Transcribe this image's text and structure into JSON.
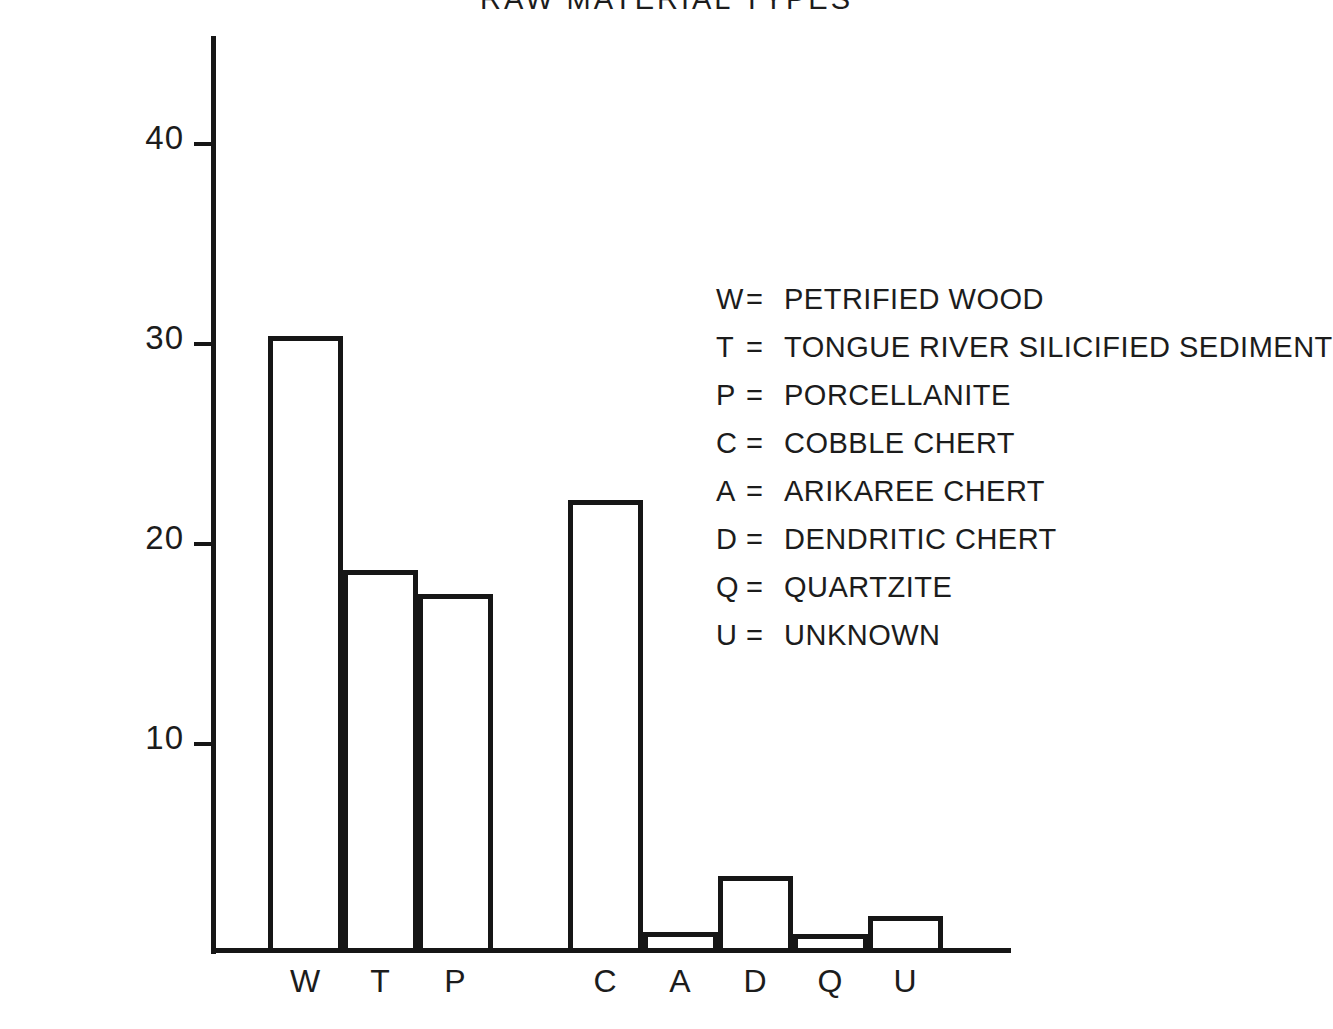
{
  "chart_data": {
    "type": "bar",
    "title": "RAW MATERIAL TYPES",
    "xlabel": "",
    "ylabel": "PERCENT",
    "ylim": [
      0,
      45
    ],
    "yticks": [
      10,
      20,
      30,
      40
    ],
    "grid": false,
    "legend_position": "inside-right",
    "categories": [
      "W",
      "T",
      "P",
      "C",
      "A",
      "D",
      "Q",
      "U"
    ],
    "values": [
      30.6,
      18.9,
      17.7,
      22.4,
      0.8,
      3.6,
      0.7,
      1.6
    ],
    "series": [
      {
        "name": "PERCENT",
        "values": [
          30.6,
          18.9,
          17.7,
          22.4,
          0.8,
          3.6,
          0.7,
          1.6
        ]
      }
    ],
    "legend_entries": [
      {
        "key": "W",
        "eq": "=",
        "description": "PETRIFIED WOOD"
      },
      {
        "key": "T",
        "eq": "=",
        "description": "TONGUE RIVER SILICIFIED SEDIMENT"
      },
      {
        "key": "P",
        "eq": "=",
        "description": "PORCELLANITE"
      },
      {
        "key": "C",
        "eq": "=",
        "description": "COBBLE CHERT"
      },
      {
        "key": "A",
        "eq": "=",
        "description": "ARIKAREE CHERT"
      },
      {
        "key": "D",
        "eq": "=",
        "description": "DENDRITIC CHERT"
      },
      {
        "key": "Q",
        "eq": "=",
        "description": "QUARTZITE"
      },
      {
        "key": "U",
        "eq": "=",
        "description": "UNKNOWN"
      }
    ],
    "colors": {
      "ink": "#161616",
      "background": "#ffffff"
    }
  },
  "ticks": [
    {
      "label": "40"
    },
    {
      "label": "30"
    },
    {
      "label": "20"
    },
    {
      "label": "10"
    }
  ],
  "bars": [
    {
      "label": "W"
    },
    {
      "label": "T"
    },
    {
      "label": "P"
    },
    {
      "label": "C"
    },
    {
      "label": "A"
    },
    {
      "label": "D"
    },
    {
      "label": "Q"
    },
    {
      "label": "U"
    }
  ]
}
